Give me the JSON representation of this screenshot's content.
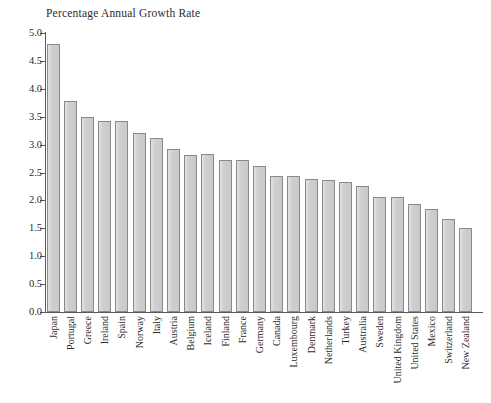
{
  "chart_data": {
    "type": "bar",
    "title": "Percentage Annual Growth Rate",
    "xlabel": "",
    "ylabel": "",
    "ylim": [
      0.0,
      5.0
    ],
    "y_ticks": [
      "0.0",
      "0.5",
      "1.0",
      "1.5",
      "2.0",
      "2.5",
      "3.0",
      "3.5",
      "4.0",
      "4.5",
      "5.0"
    ],
    "y_tick_values": [
      0.0,
      0.5,
      1.0,
      1.5,
      2.0,
      2.5,
      3.0,
      3.5,
      4.0,
      4.5,
      5.0
    ],
    "grid": false,
    "legend": false,
    "bar_color": "#d3d3d3",
    "bar_edge_color": "#8a8a8a",
    "axis_color": "#5a5a5a",
    "categories": [
      "Japan",
      "Portugal",
      "Greece",
      "Ireland",
      "Spain",
      "Norway",
      "Italy",
      "Austria",
      "Belgium",
      "Iceland",
      "Finland",
      "France",
      "Germany",
      "Canada",
      "Luxembourg",
      "Denmark",
      "Netherlands",
      "Turkey",
      "Australia",
      "Sweden",
      "United Kingdom",
      "United States",
      "Mexico",
      "Switzerland",
      "New Zealand"
    ],
    "values": [
      4.8,
      3.79,
      3.49,
      3.42,
      3.42,
      3.21,
      3.12,
      2.93,
      2.82,
      2.84,
      2.72,
      2.72,
      2.61,
      2.43,
      2.43,
      2.38,
      2.36,
      2.33,
      2.25,
      2.07,
      2.07,
      1.94,
      1.84,
      1.67,
      1.5
    ]
  }
}
